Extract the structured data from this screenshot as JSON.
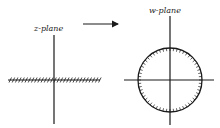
{
  "diagram": {
    "left_panel": {
      "label": "z-plane",
      "feature": "hatched-horizontal-line"
    },
    "arrow": {
      "direction": "right"
    },
    "right_panel": {
      "label": "w-plane",
      "feature": "hatched-unit-circle"
    }
  },
  "colors": {
    "ink": "#1a1a1a",
    "background": "#ffffff"
  }
}
